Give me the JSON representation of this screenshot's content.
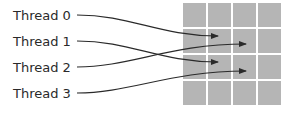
{
  "threads": [
    {
      "label": "Thread 0",
      "target": {
        "row": 1,
        "col": 1
      }
    },
    {
      "label": "Thread 1",
      "target": {
        "row": 2,
        "col": 1
      }
    },
    {
      "label": "Thread 2",
      "target": {
        "row": 1,
        "col": 2
      }
    },
    {
      "label": "Thread 3",
      "target": {
        "row": 2,
        "col": 2
      }
    }
  ],
  "grid": {
    "rows": 4,
    "cols": 4,
    "cell_color": "#b5b5b5"
  },
  "colors": {
    "line": "#2a2a2a",
    "text": "#2a2a2a",
    "background": "#ffffff"
  }
}
